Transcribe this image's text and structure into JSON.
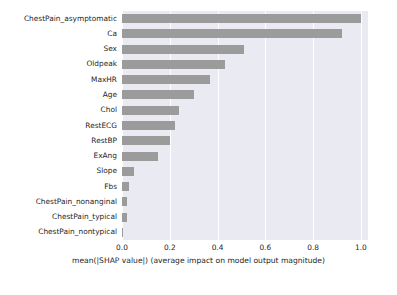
{
  "chart_data": {
    "type": "bar",
    "orientation": "horizontal",
    "title": "",
    "xlabel": "mean(|SHAP value|) (average impact on model output magnitude)",
    "ylabel": "",
    "xlim": [
      0.0,
      1.03
    ],
    "xticks": [
      "0.0",
      "0.2",
      "0.4",
      "0.6",
      "0.8",
      "1.0"
    ],
    "xtick_values": [
      0.0,
      0.2,
      0.4,
      0.6,
      0.8,
      1.0
    ],
    "grid": true,
    "legend": "none",
    "bar_color": "#9b9b9b",
    "plot_background": "#eaeaf2",
    "categories": [
      "ChestPain_asymptomatic",
      "Ca",
      "Sex",
      "Oldpeak",
      "MaxHR",
      "Age",
      "Chol",
      "RestECG",
      "RestBP",
      "ExAng",
      "Slope",
      "Fbs",
      "ChestPain_nonanginal",
      "ChestPain_typical",
      "ChestPain_nontypical"
    ],
    "values": [
      1.0,
      0.92,
      0.51,
      0.43,
      0.37,
      0.3,
      0.24,
      0.22,
      0.2,
      0.15,
      0.05,
      0.028,
      0.022,
      0.02,
      0.005
    ]
  }
}
